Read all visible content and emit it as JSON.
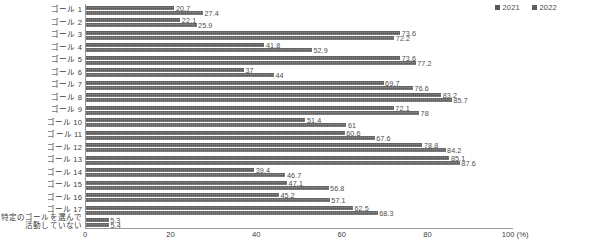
{
  "chart_data": {
    "type": "bar",
    "orientation": "horizontal",
    "title": "",
    "xlabel": "100 (%)",
    "ylabel": "",
    "xlim": [
      0,
      100
    ],
    "xticks": [
      "0",
      "20",
      "40",
      "60",
      "80",
      "100 (%)"
    ],
    "grid": false,
    "legend_position": "top-right",
    "categories": [
      "ゴール 1",
      "ゴール 2",
      "ゴール 3",
      "ゴール 4",
      "ゴール 5",
      "ゴール 6",
      "ゴール 7",
      "ゴール 8",
      "ゴール 9",
      "ゴール 10",
      "ゴール 11",
      "ゴール 12",
      "ゴール 13",
      "ゴール 14",
      "ゴール 15",
      "ゴール 16",
      "ゴール 17",
      "特定のゴールを選んで活動していない"
    ],
    "categories_lines": [
      [
        "ゴール 1"
      ],
      [
        "ゴール 2"
      ],
      [
        "ゴール 3"
      ],
      [
        "ゴール 4"
      ],
      [
        "ゴール 5"
      ],
      [
        "ゴール 6"
      ],
      [
        "ゴール 7"
      ],
      [
        "ゴール 8"
      ],
      [
        "ゴール 9"
      ],
      [
        "ゴール 10"
      ],
      [
        "ゴール 11"
      ],
      [
        "ゴール 12"
      ],
      [
        "ゴール 13"
      ],
      [
        "ゴール 14"
      ],
      [
        "ゴール 15"
      ],
      [
        "ゴール 16"
      ],
      [
        "ゴール 17"
      ],
      [
        "特定のゴールを選んで",
        "活動していない"
      ]
    ],
    "series": [
      {
        "name": "2021",
        "color": "#585858",
        "values": [
          20.7,
          22.1,
          73.6,
          41.8,
          73.6,
          37,
          69.7,
          83.2,
          72.1,
          51.4,
          60.6,
          78.8,
          85.1,
          39.4,
          47.1,
          45.2,
          62.5,
          5.3
        ],
        "labels": [
          "20.7",
          "22.1",
          "73.6",
          "41.8",
          "73.6",
          "37",
          "69.7",
          "83.2",
          "72.1",
          "51.4",
          "60.6",
          "78.8",
          "85.1",
          "39.4",
          "47.1",
          "45.2",
          "62.5",
          "5.3"
        ]
      },
      {
        "name": "2022",
        "color": "#5e5e5e",
        "values": [
          27.4,
          25.9,
          72.2,
          52.9,
          77.2,
          44,
          76.6,
          85.7,
          78,
          61,
          67.6,
          84.2,
          87.6,
          46.7,
          56.8,
          57.1,
          68.3,
          5.4
        ],
        "labels": [
          "27.4",
          "25.9",
          "72.2",
          "52.9",
          "77.2",
          "44",
          "76.6",
          "85.7",
          "78",
          "61",
          "67.6",
          "84.2",
          "87.6",
          "46.7",
          "56.8",
          "57.1",
          "68.3",
          "5.4"
        ]
      }
    ]
  },
  "legend": {
    "entries": [
      {
        "label": "2021",
        "color": "#585858"
      },
      {
        "label": "2022",
        "color": "#5e5e5e"
      }
    ]
  },
  "axis": {
    "x_ticks": [
      {
        "label": "0",
        "value": 0
      },
      {
        "label": "20",
        "value": 20
      },
      {
        "label": "40",
        "value": 40
      },
      {
        "label": "60",
        "value": 60
      },
      {
        "label": "80",
        "value": 80
      },
      {
        "label": "100 (%)",
        "value": 100
      }
    ]
  }
}
